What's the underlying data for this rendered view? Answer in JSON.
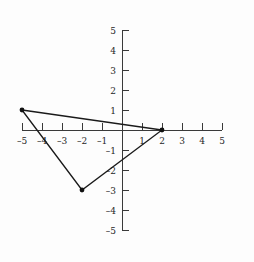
{
  "chart_data": {
    "type": "scatter",
    "title": "",
    "subtitle": "",
    "xlabel": "",
    "ylabel": "",
    "xlim": [
      -5,
      5
    ],
    "ylim": [
      -5,
      5
    ],
    "grid": false,
    "legend": null,
    "x_ticks": [
      -5,
      -4,
      -3,
      -2,
      -1,
      1,
      2,
      3,
      4,
      5
    ],
    "y_ticks": [
      5,
      4,
      3,
      2,
      1,
      -1,
      -2,
      -3,
      -4,
      -5
    ],
    "x_tick_labels": [
      "–5",
      "–4",
      "–3",
      "–2",
      "–1",
      "1",
      "2",
      "3",
      "4",
      "5"
    ],
    "y_tick_labels": [
      "5",
      "4",
      "3",
      "2",
      "1",
      "–1",
      "–2",
      "–3",
      "–4",
      "–5"
    ],
    "series": [
      {
        "name": "triangle",
        "type": "polygon",
        "closed": true,
        "color": "#1a1a1a",
        "marker": "filled-circle",
        "points": [
          {
            "x": -5,
            "y": 1,
            "label": "(–5, 1)"
          },
          {
            "x": 2,
            "y": 0,
            "label": "(2, 0)"
          },
          {
            "x": -2,
            "y": -3,
            "label": "(–2, –3)"
          }
        ]
      }
    ]
  },
  "geometry": {
    "origin_px": {
      "x": 122,
      "y": 130
    },
    "unit_px": 20,
    "x_axis_span": [
      22,
      222
    ],
    "y_axis_span": [
      30,
      230
    ],
    "tick_length_px": 7,
    "axis_color": "#3a3a3a",
    "shape_color": "#1a1a1a",
    "background_color": "#fdfdfd"
  }
}
